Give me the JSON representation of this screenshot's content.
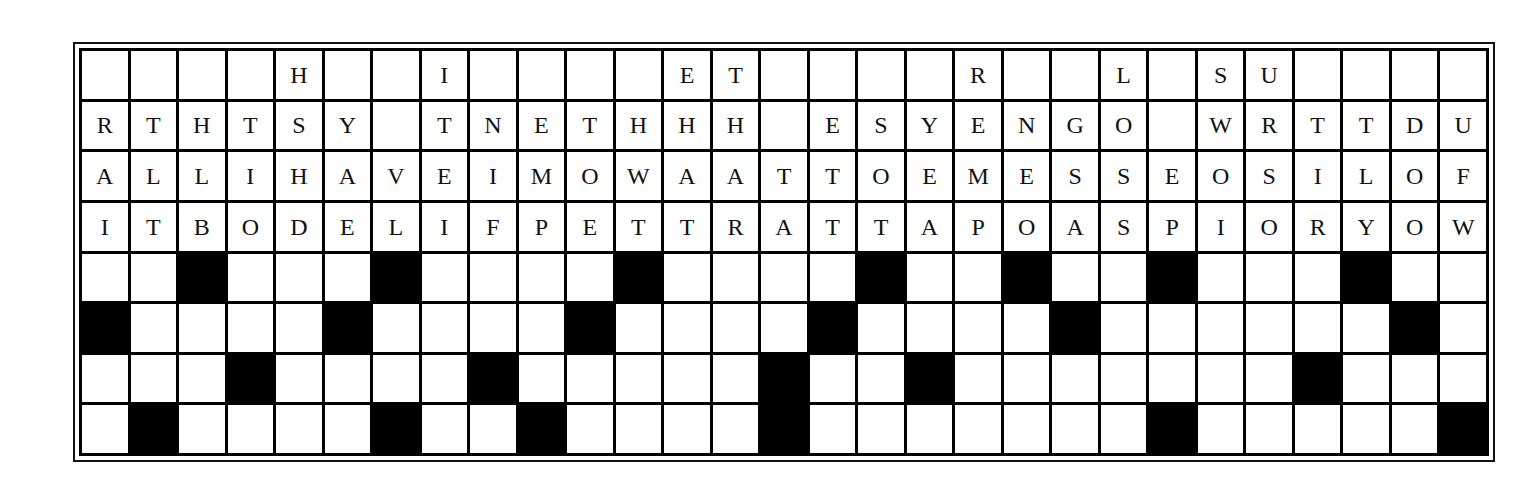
{
  "puzzle": {
    "type": "fallen-phrase",
    "columns": 29,
    "colors": {
      "black_cell": "#000000",
      "white_cell": "#ffffff",
      "grid_line": "#000000",
      "letter": "#111111"
    },
    "letter_rows": [
      [
        "",
        "",
        "",
        "",
        "H",
        "",
        "",
        "I",
        "",
        "",
        "",
        "",
        "E",
        "T",
        "",
        "",
        "",
        "",
        "R",
        "",
        "",
        "L",
        "",
        "S",
        "U",
        "",
        "",
        "",
        ""
      ],
      [
        "R",
        "T",
        "H",
        "T",
        "S",
        "Y",
        "",
        "T",
        "N",
        "E",
        "T",
        "H",
        "H",
        "H",
        "",
        "E",
        "S",
        "Y",
        "E",
        "N",
        "G",
        "O",
        "",
        "W",
        "R",
        "T",
        "T",
        "D",
        "U"
      ],
      [
        "A",
        "L",
        "L",
        "I",
        "H",
        "A",
        "V",
        "E",
        "I",
        "M",
        "O",
        "W",
        "A",
        "A",
        "T",
        "T",
        "O",
        "E",
        "M",
        "E",
        "S",
        "S",
        "E",
        "O",
        "S",
        "I",
        "L",
        "O",
        "F"
      ],
      [
        "I",
        "T",
        "B",
        "O",
        "D",
        "E",
        "L",
        "I",
        "F",
        "P",
        "E",
        "T",
        "T",
        "R",
        "A",
        "T",
        "T",
        "A",
        "P",
        "O",
        "A",
        "S",
        "P",
        "I",
        "O",
        "R",
        "Y",
        "O",
        "W"
      ]
    ],
    "answer_rows_black_cells": [
      [
        2,
        6,
        11,
        16,
        19,
        22,
        26
      ],
      [
        0,
        5,
        10,
        15,
        20,
        27
      ],
      [
        3,
        8,
        14,
        17,
        25
      ],
      [
        1,
        6,
        9,
        14,
        22,
        28
      ]
    ]
  }
}
